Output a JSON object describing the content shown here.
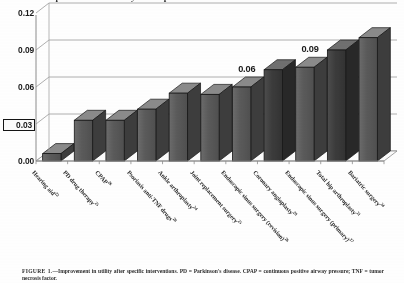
{
  "figure": {
    "title": "Improvement in utility after specific interventions",
    "caption_label": "FIGURE 1.",
    "caption_text": "—Improvement in utility after specific interventions. PD = Parkinson's disease. CPAP = continuous positive airway pressure; TNF = tumor necrosis factor."
  },
  "axis": {
    "y_ticks": [
      "0.00",
      "0.03",
      "0.06",
      "0.09",
      "0.12"
    ],
    "y_highlight_tick": "0.03",
    "y_min": 0.0,
    "y_max": 0.12,
    "x_title": ""
  },
  "annotations": [
    {
      "label": "0.06",
      "bar_index": 6
    },
    {
      "label": "0.09",
      "bar_index": 8
    }
  ],
  "colors": {
    "bar_face": "#5a5a5a",
    "bar_face_dark": "#3a3a3a",
    "bar_side": "#4a4a4a",
    "bar_top": "#7d7d7d",
    "axis": "#8c8c8c",
    "text": "#1a1a1a",
    "background": "#ffffff"
  },
  "chart_data": {
    "type": "bar",
    "title": "Improvement in utility after specific interventions",
    "xlabel": "",
    "ylabel": "",
    "ylim": [
      0,
      0.12
    ],
    "yticks": [
      0.0,
      0.03,
      0.06,
      0.09,
      0.12
    ],
    "grid": true,
    "legend": "none",
    "three_d": true,
    "categories": [
      "Hearing aid",
      "PD drug therapy",
      "CPAP",
      "Psoriasis anti-TNF drugs",
      "Ankle arthroplasty",
      "Joint replacement surgery",
      "Endoscopic sinus surgery (revision)",
      "Coronary angioplasty",
      "Endoscopic sinus surgery (primary)",
      "Total hip arthroplasty",
      "Bariatric surgery"
    ],
    "category_refs": [
      "22",
      "25",
      "26",
      "28",
      "24",
      "25",
      "26",
      "28",
      "27",
      "21",
      "24"
    ],
    "values": [
      0.006,
      0.033,
      0.033,
      0.042,
      0.055,
      0.054,
      0.06,
      0.074,
      0.076,
      0.09,
      0.1
    ],
    "value_labels": [
      "",
      "",
      "",
      "",
      "",
      "",
      "0.06",
      "",
      "0.09",
      "",
      ""
    ],
    "highlighted_bars": [
      7,
      9
    ]
  }
}
